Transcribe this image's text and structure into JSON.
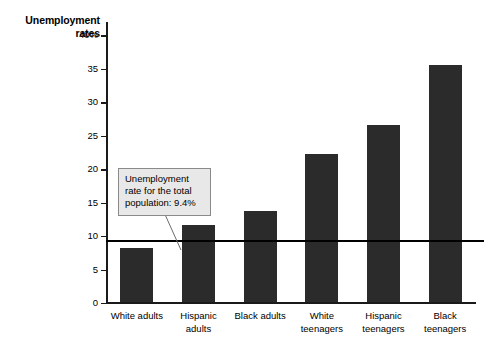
{
  "chart_data": {
    "type": "bar",
    "title": "Unemployment\nrates",
    "xlabel": "",
    "ylabel": "Unemployment rates",
    "categories": [
      "White adults",
      "Hispanic\nadults",
      "Black adults",
      "White\nteenagers",
      "Hispanic\nteenagers",
      "Black\nteenagers"
    ],
    "values": [
      8.0,
      11.5,
      13.6,
      22.1,
      26.5,
      35.5
    ],
    "ylim": [
      0,
      42
    ],
    "yticks": [
      0,
      5,
      10,
      15,
      20,
      25,
      30,
      35,
      40
    ],
    "ytick_labels": [
      "0",
      "5",
      "10",
      "15",
      "20",
      "25",
      "30",
      "35",
      "40%"
    ],
    "grid": false,
    "legend": false,
    "bar_color": "#2b2b2b",
    "reference_line": {
      "value": 9.4,
      "label": "Unemployment rate for the total population: 9.4%",
      "color": "#000000"
    }
  },
  "annotations": {
    "callout_text": "Unemployment rate for the total population: 9.4%",
    "callout_fill": "#e8e8e8",
    "callout_border": "#8a8a8a"
  }
}
